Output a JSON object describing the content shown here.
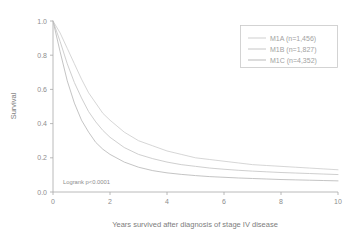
{
  "chart_data": {
    "type": "line",
    "title": "",
    "subtitle": "",
    "xlabel": "Years survived after diagnosis of stage IV disease",
    "ylabel": "Survival",
    "xlim": [
      0,
      10
    ],
    "ylim": [
      0,
      1.0
    ],
    "xticks": [
      0,
      2,
      4,
      6,
      8,
      10
    ],
    "xticklabels": [
      "0",
      "2",
      "4",
      "6",
      "8",
      "10"
    ],
    "yticks": [
      0.0,
      0.2,
      0.4,
      0.6,
      0.8,
      1.0
    ],
    "yticklabels": [
      "0.0",
      "0.2",
      "0.4",
      "0.6",
      "0.8",
      "1.0"
    ],
    "grid": false,
    "legend_position": "upper right",
    "annotations": [
      {
        "text": "Logrank p<0.0001",
        "x": 0.35,
        "y": 0.04
      }
    ],
    "series": [
      {
        "name": "M1A",
        "label": "M1A (n=1,456)",
        "n": 1456,
        "color": "#cfcfcf",
        "x": [
          0,
          0.25,
          0.5,
          0.75,
          1.0,
          1.25,
          1.5,
          1.75,
          2.0,
          2.5,
          3.0,
          3.5,
          4.0,
          4.5,
          5.0,
          5.5,
          6.0,
          6.5,
          7.0,
          7.5,
          8.0,
          8.5,
          9.0,
          9.5,
          10.0
        ],
        "y": [
          1.0,
          0.93,
          0.84,
          0.75,
          0.66,
          0.58,
          0.52,
          0.46,
          0.42,
          0.35,
          0.3,
          0.27,
          0.24,
          0.22,
          0.2,
          0.19,
          0.18,
          0.17,
          0.16,
          0.155,
          0.15,
          0.145,
          0.14,
          0.135,
          0.13
        ]
      },
      {
        "name": "M1B",
        "label": "M1B (n=1,827)",
        "n": 1827,
        "color": "#c6c6c6",
        "x": [
          0,
          0.25,
          0.5,
          0.75,
          1.0,
          1.25,
          1.5,
          1.75,
          2.0,
          2.5,
          3.0,
          3.5,
          4.0,
          4.5,
          5.0,
          5.5,
          6.0,
          6.5,
          7.0,
          7.5,
          8.0,
          8.5,
          9.0,
          9.5,
          10.0
        ],
        "y": [
          1.0,
          0.88,
          0.75,
          0.64,
          0.55,
          0.47,
          0.41,
          0.36,
          0.32,
          0.26,
          0.22,
          0.195,
          0.175,
          0.16,
          0.15,
          0.14,
          0.133,
          0.127,
          0.122,
          0.118,
          0.114,
          0.111,
          0.108,
          0.105,
          0.102
        ]
      },
      {
        "name": "M1C",
        "label": "M1C (n=4,352)",
        "n": 4352,
        "color": "#b9b9b9",
        "x": [
          0,
          0.25,
          0.5,
          0.75,
          1.0,
          1.25,
          1.5,
          1.75,
          2.0,
          2.5,
          3.0,
          3.5,
          4.0,
          4.5,
          5.0,
          5.5,
          6.0,
          6.5,
          7.0,
          7.5,
          8.0,
          8.5,
          9.0,
          9.5,
          10.0
        ],
        "y": [
          1.0,
          0.82,
          0.65,
          0.52,
          0.42,
          0.35,
          0.29,
          0.25,
          0.22,
          0.175,
          0.145,
          0.125,
          0.112,
          0.103,
          0.096,
          0.09,
          0.086,
          0.082,
          0.079,
          0.076,
          0.073,
          0.071,
          0.069,
          0.067,
          0.065
        ]
      }
    ]
  },
  "colors": {
    "background": "#ffffff",
    "axis": "#a8a8a8",
    "text": "#8d8d8d",
    "legend_border": "#c9c9c9"
  }
}
